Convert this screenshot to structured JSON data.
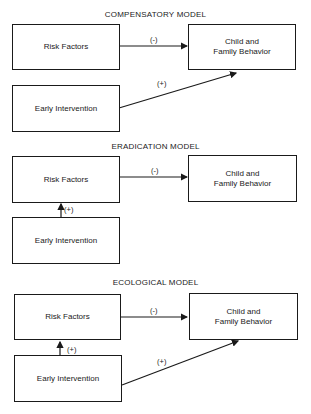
{
  "models": [
    {
      "title": "COMPENSATORY MODEL",
      "risk_factors": "Risk Factors",
      "early_intervention": "Early Intervention",
      "outcome_line1": "Child and",
      "outcome_line2": "Family Behavior",
      "risk_to_outcome_sign": "(-)",
      "intervention_to_outcome_sign": "(+)"
    },
    {
      "title": "ERADICATION MODEL",
      "risk_factors": "Risk Factors",
      "early_intervention": "Early Intervention",
      "outcome_line1": "Child and",
      "outcome_line2": "Family Behavior",
      "risk_to_outcome_sign": "(-)",
      "intervention_to_risk_sign": "(+)"
    },
    {
      "title": "ECOLOGICAL MODEL",
      "risk_factors": "Risk Factors",
      "early_intervention": "Early Intervention",
      "outcome_line1": "Child and",
      "outcome_line2": "Family Behavior",
      "risk_to_outcome_sign": "(-)",
      "intervention_to_risk_sign": "(+)",
      "intervention_to_outcome_sign": "(+)"
    }
  ]
}
